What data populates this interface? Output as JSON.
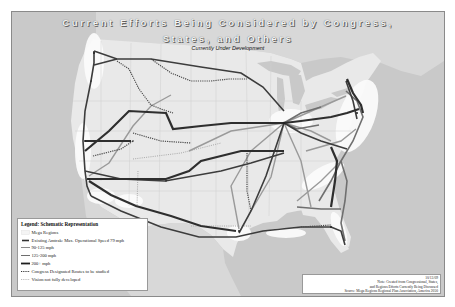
{
  "map": {
    "title_line1": "Current Efforts Being Considered by Congress,",
    "title_line2": "States, and Others",
    "subtitle": "Currently Under Development",
    "colors": {
      "ocean": "#c9c9c9",
      "land": "#e9e9e9",
      "mega_region": "#fafafa",
      "existing_amtrak": "#3a3a3a",
      "speed_90_125": "#8c8c8c",
      "speed_125_200": "#6e6e6e",
      "speed_200_plus": "#2e2e2e",
      "congress_routes": "#555555",
      "vision_routes": "#a0a0a0"
    }
  },
  "legend": {
    "title": "Legend: Schematic Representation",
    "items": [
      {
        "label": "Mega Regions",
        "style": "area"
      },
      {
        "label": "Existing Amtrak: Max. Operational Speed 79 mph",
        "style": "thick-dark"
      },
      {
        "label": "90-125 mph",
        "style": "thin-light"
      },
      {
        "label": "125-200 mph",
        "style": "thin-mid"
      },
      {
        "label": "200+ mph",
        "style": "thick-black"
      },
      {
        "label": "Congress Designated Routes to be studied",
        "style": "dotted-dark"
      },
      {
        "label": "Vision not fully developed",
        "style": "dotted-light"
      }
    ]
  },
  "note": {
    "date": "10/13/09",
    "line1": "Note: Created from Congressional, States,",
    "line2": "and Regions Efforts Currently Being Discussed",
    "source": "Source: Mega Regions Regional Plan Association, America 2050"
  }
}
